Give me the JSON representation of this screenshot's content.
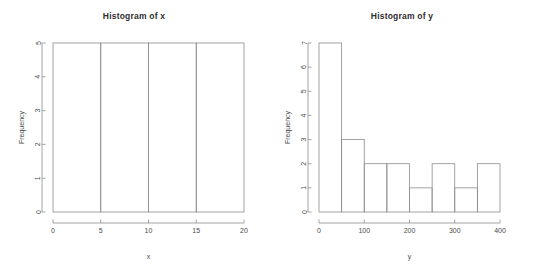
{
  "figure": {
    "background": "#ffffff",
    "line_color": "#8d8d8d",
    "text_color": "#3a3a3a",
    "width": 536,
    "height": 279
  },
  "chart_data": [
    {
      "type": "bar",
      "title": "Histogram of x",
      "xlabel": "x",
      "ylabel": "Frequency",
      "bin_edges": [
        0,
        5,
        10,
        15,
        20
      ],
      "categories": [
        "0-5",
        "5-10",
        "10-15",
        "15-20"
      ],
      "values": [
        5,
        5,
        5,
        5
      ],
      "xlim": [
        0,
        20
      ],
      "ylim": [
        0,
        5
      ],
      "xticks": [
        0,
        5,
        10,
        15,
        20
      ],
      "xtick_labels": [
        "0",
        "5",
        "10",
        "15",
        "20"
      ],
      "yticks": [
        0,
        1,
        2,
        3,
        4,
        5
      ],
      "ytick_labels": [
        "0",
        "1",
        "2",
        "3",
        "4",
        "5"
      ],
      "grid": false,
      "legend": "none",
      "bar_fill": "none",
      "bar_stroke": "#8d8d8d"
    },
    {
      "type": "bar",
      "title": "Histogram of y",
      "xlabel": "y",
      "ylabel": "Frequency",
      "bin_edges": [
        0,
        50,
        100,
        150,
        200,
        250,
        300,
        350,
        400
      ],
      "categories": [
        "0-50",
        "50-100",
        "100-150",
        "150-200",
        "200-250",
        "250-300",
        "300-350",
        "350-400"
      ],
      "values": [
        7,
        3,
        2,
        2,
        1,
        2,
        1,
        2
      ],
      "xlim": [
        0,
        400
      ],
      "ylim": [
        0,
        7
      ],
      "xticks": [
        0,
        100,
        200,
        300,
        400
      ],
      "xtick_labels": [
        "0",
        "100",
        "200",
        "300",
        "400"
      ],
      "yticks": [
        0,
        1,
        2,
        3,
        4,
        5,
        6,
        7
      ],
      "ytick_labels": [
        "0",
        "1",
        "2",
        "3",
        "4",
        "5",
        "6",
        "7"
      ],
      "grid": false,
      "legend": "none",
      "bar_fill": "none",
      "bar_stroke": "#8d8d8d"
    }
  ]
}
